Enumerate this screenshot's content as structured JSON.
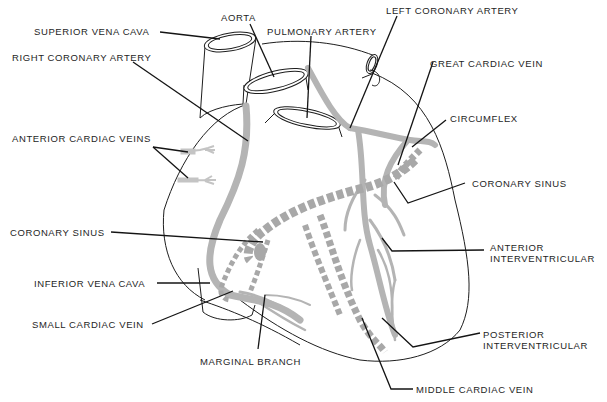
{
  "diagram": {
    "type": "anatomical-labeled-illustration",
    "colors": {
      "outline": "#1e1e1e",
      "vessel_fill": "#b4b4b4",
      "vein_dash": "#a8a8a8",
      "leader": "#141414",
      "background": "#ffffff"
    },
    "labels": [
      {
        "id": "superior-vena-cava",
        "text": "SUPERIOR VENA CAVA"
      },
      {
        "id": "aorta",
        "text": "AORTA"
      },
      {
        "id": "pulmonary-artery",
        "text": "PULMONARY ARTERY"
      },
      {
        "id": "left-coronary-artery",
        "text": "LEFT CORONARY ARTERY"
      },
      {
        "id": "right-coronary-artery",
        "text": "RIGHT CORONARY ARTERY"
      },
      {
        "id": "great-cardiac-vein",
        "text": "GREAT CARDIAC VEIN"
      },
      {
        "id": "circumflex",
        "text": "CIRCUMFLEX"
      },
      {
        "id": "anterior-cardiac-veins",
        "text": "ANTERIOR CARDIAC VEINS"
      },
      {
        "id": "coronary-sinus-right",
        "text": "CORONARY SINUS"
      },
      {
        "id": "coronary-sinus-left",
        "text": "CORONARY SINUS"
      },
      {
        "id": "anterior-interventricular",
        "line1": "ANTERIOR",
        "line2": "INTERVENTRICULAR"
      },
      {
        "id": "inferior-vena-cava",
        "text": "INFERIOR VENA CAVA"
      },
      {
        "id": "small-cardiac-vein",
        "text": "SMALL CARDIAC VEIN"
      },
      {
        "id": "marginal-branch",
        "text": "MARGINAL BRANCH"
      },
      {
        "id": "posterior-interventricular",
        "line1": "POSTERIOR",
        "line2": "INTERVENTRICULAR"
      },
      {
        "id": "middle-cardiac-vein",
        "text": "MIDDLE CARDIAC VEIN"
      }
    ]
  }
}
